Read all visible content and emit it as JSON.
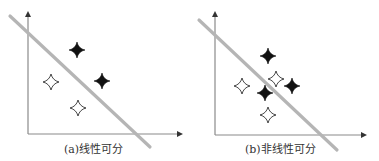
{
  "colors": {
    "axis": "#8a8a8a",
    "boundary_line": "#b5b5b5",
    "filled_star": "#111111",
    "hollow_star_stroke": "#333333",
    "caption": "#333333"
  },
  "panels": [
    {
      "id": "a",
      "caption": "(a)线性可分",
      "axis": {
        "origin": [
          28,
          134
        ],
        "y_top": 11,
        "x_right": 183
      },
      "boundary": {
        "x1": 10,
        "y1": 16,
        "x2": 150,
        "y2": 147
      },
      "filled_points": [
        [
          77,
          50
        ],
        [
          102,
          81
        ]
      ],
      "hollow_points": [
        [
          51,
          82
        ],
        [
          78,
          108
        ]
      ],
      "caption_pos": [
        64,
        140
      ]
    },
    {
      "id": "b",
      "caption": "(b)非线性可分",
      "axis": {
        "origin": [
          215,
          135
        ],
        "y_top": 11,
        "x_right": 367
      },
      "boundary": {
        "x1": 199,
        "y1": 20,
        "x2": 337,
        "y2": 150
      },
      "filled_points": [
        [
          268,
          56
        ],
        [
          292,
          86
        ],
        [
          265,
          93
        ]
      ],
      "hollow_points": [
        [
          242,
          86
        ],
        [
          276,
          79
        ],
        [
          268,
          115
        ]
      ],
      "caption_pos": [
        245,
        140
      ]
    }
  ]
}
